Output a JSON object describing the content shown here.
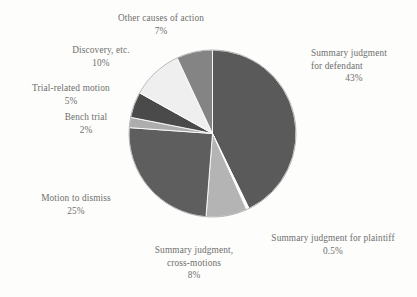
{
  "chart_data": {
    "type": "pie",
    "title": "",
    "subtitle": "",
    "xlabel": "",
    "ylabel": "",
    "legend_position": "callout-labels",
    "grid": false,
    "units": "percent",
    "start_angle_deg": 0,
    "direction": "clockwise",
    "categories": [
      "Summary judgment for defendant",
      "Summary judgment for plaintiff",
      "Summary judgment, cross-motions",
      "Motion to dismiss",
      "Bench trial",
      "Trial-related motion",
      "Discovery, etc.",
      "Other causes of action"
    ],
    "values": [
      43,
      0.5,
      8,
      25,
      2,
      5,
      10,
      7
    ],
    "value_labels": [
      "43%",
      "0.5%",
      "8%",
      "25%",
      "2%",
      "5%",
      "10%",
      "7%"
    ],
    "colors": [
      "#5a5a5a",
      "#fbfbf9",
      "#b4b4b4",
      "#5e5e5e",
      "#adadad",
      "#4a4a4a",
      "#efefef",
      "#848484"
    ],
    "slices": [
      {
        "label": "Summary judgment for defendant",
        "label_line1": "Summary judgment",
        "label_line2": "for defendant",
        "value": 43,
        "pct": "43%",
        "color": "#5a5a5a"
      },
      {
        "label": "Summary judgment for plaintiff",
        "label_line1": "Summary judgment for plaintiff",
        "label_line2": "",
        "value": 0.5,
        "pct": "0.5%",
        "color": "#fbfbf9"
      },
      {
        "label": "Summary judgment, cross-motions",
        "label_line1": "Summary judgment,",
        "label_line2": "cross-motions",
        "value": 8,
        "pct": "8%",
        "color": "#b4b4b4"
      },
      {
        "label": "Motion to dismiss",
        "label_line1": "Motion to dismiss",
        "label_line2": "",
        "value": 25,
        "pct": "25%",
        "color": "#5e5e5e"
      },
      {
        "label": "Bench trial",
        "label_line1": "Bench trial",
        "label_line2": "",
        "value": 2,
        "pct": "2%",
        "color": "#adadad"
      },
      {
        "label": "Trial-related motion",
        "label_line1": "Trial-related motion",
        "label_line2": "",
        "value": 5,
        "pct": "5%",
        "color": "#4a4a4a"
      },
      {
        "label": "Discovery, etc.",
        "label_line1": "Discovery, etc.",
        "label_line2": "",
        "value": 10,
        "pct": "10%",
        "color": "#efefef"
      },
      {
        "label": "Other causes of action",
        "label_line1": "Other causes of action",
        "label_line2": "",
        "value": 7,
        "pct": "7%",
        "color": "#848484"
      }
    ]
  },
  "style": {
    "background": "#fdfdfb",
    "text_color": "#6e6e6e",
    "slice_stroke": "#ffffff"
  }
}
